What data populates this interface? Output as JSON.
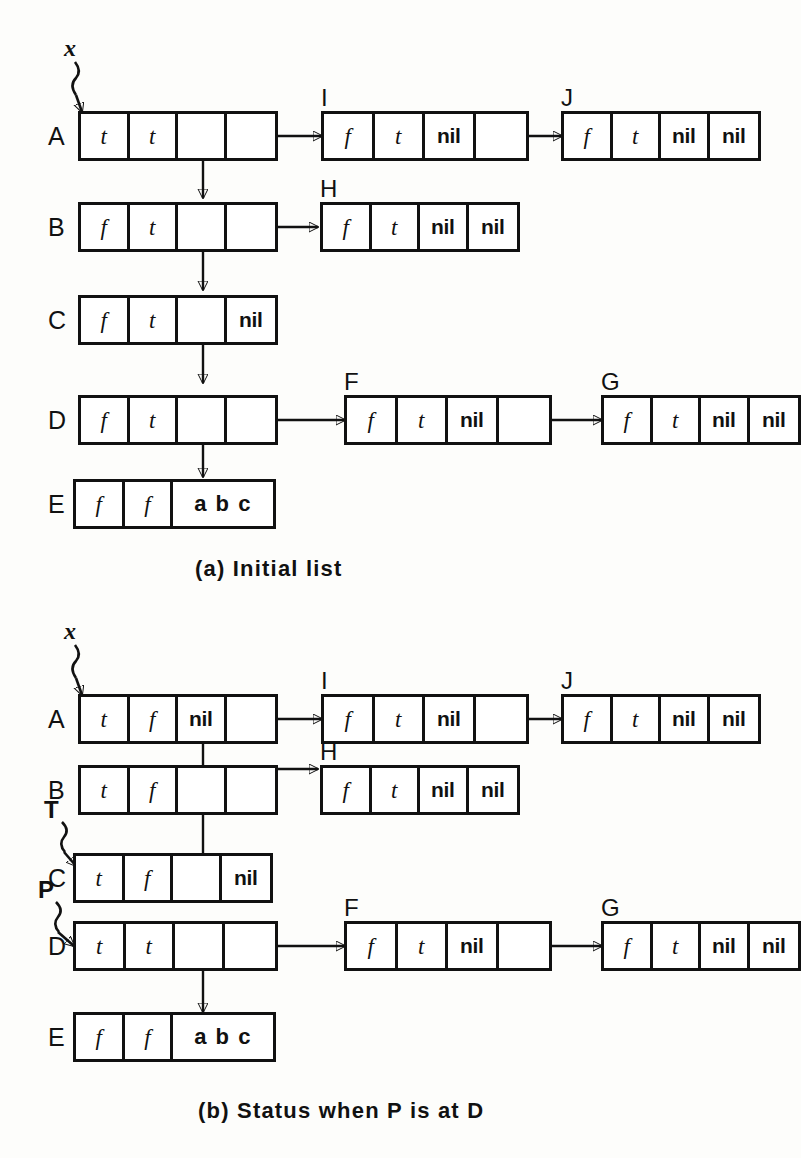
{
  "figure": {
    "title_a": "(a)   Initial list",
    "title_b": "(b)   Status when P is at D"
  },
  "panel_a": {
    "pointer_vars": [
      {
        "name": "x",
        "target": "A"
      }
    ],
    "row_labels": [
      "A",
      "B",
      "C",
      "D",
      "E"
    ],
    "node_labels": [
      "I",
      "J",
      "H",
      "F",
      "G"
    ],
    "nodes": {
      "A": {
        "label": "A",
        "cells": [
          "t",
          "t",
          "ptr-down",
          "ptr-right"
        ]
      },
      "B": {
        "label": "B",
        "cells": [
          "f",
          "t",
          "ptr-down",
          "ptr-right"
        ]
      },
      "C": {
        "label": "C",
        "cells": [
          "f",
          "t",
          "ptr-down",
          "nil"
        ]
      },
      "D": {
        "label": "D",
        "cells": [
          "f",
          "t",
          "ptr-down",
          "ptr-right"
        ]
      },
      "E": {
        "label": "E",
        "cells": [
          "f",
          "f",
          "abc"
        ]
      },
      "I": {
        "label": "I",
        "cells": [
          "f",
          "t",
          "nil",
          "ptr-right"
        ]
      },
      "J": {
        "label": "J",
        "cells": [
          "f",
          "t",
          "nil",
          "nil"
        ]
      },
      "H": {
        "label": "H",
        "cells": [
          "f",
          "t",
          "nil",
          "nil"
        ]
      },
      "F": {
        "label": "F",
        "cells": [
          "f",
          "t",
          "nil",
          "ptr-right"
        ]
      },
      "G": {
        "label": "G",
        "cells": [
          "f",
          "t",
          "nil",
          "nil"
        ]
      }
    },
    "cell_text": {
      "t": "t",
      "f": "f",
      "nil": "nil",
      "abc": "a b c",
      "ptr-down": "",
      "ptr-right": ""
    }
  },
  "panel_b": {
    "pointer_vars": [
      {
        "name": "x",
        "target": "A"
      },
      {
        "name": "T",
        "target": "C"
      },
      {
        "name": "P",
        "target": "D"
      }
    ],
    "row_labels": [
      "A",
      "B",
      "C",
      "D",
      "E"
    ],
    "node_labels": [
      "I",
      "J",
      "H",
      "F",
      "G"
    ],
    "nodes": {
      "A": {
        "label": "A",
        "cells": [
          "t",
          "f",
          "nil",
          "ptr-right"
        ]
      },
      "B": {
        "label": "B",
        "cells": [
          "t",
          "f",
          "ptr-up",
          "ptr-right"
        ]
      },
      "C": {
        "label": "C",
        "cells": [
          "t",
          "f",
          "ptr-up",
          "nil"
        ]
      },
      "D": {
        "label": "D",
        "cells": [
          "t",
          "t",
          "ptr-down",
          "ptr-right"
        ]
      },
      "E": {
        "label": "E",
        "cells": [
          "f",
          "f",
          "abc"
        ]
      },
      "I": {
        "label": "I",
        "cells": [
          "f",
          "t",
          "nil",
          "ptr-right"
        ]
      },
      "J": {
        "label": "J",
        "cells": [
          "f",
          "t",
          "nil",
          "nil"
        ]
      },
      "H": {
        "label": "H",
        "cells": [
          "f",
          "t",
          "nil",
          "nil"
        ]
      },
      "F": {
        "label": "F",
        "cells": [
          "f",
          "t",
          "nil",
          "ptr-right"
        ]
      },
      "G": {
        "label": "G",
        "cells": [
          "f",
          "t",
          "nil",
          "nil"
        ]
      }
    },
    "cell_text": {
      "t": "t",
      "f": "f",
      "nil": "nil",
      "abc": "a b c",
      "ptr-up": "",
      "ptr-down": "",
      "ptr-right": ""
    }
  },
  "colors": {
    "ink": "#111111",
    "paper": "#fdfdfb"
  }
}
